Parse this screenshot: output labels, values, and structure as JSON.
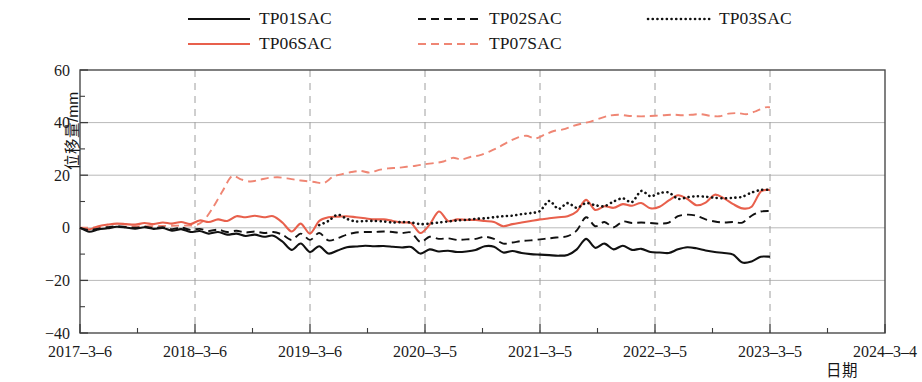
{
  "chart_data": {
    "type": "line",
    "title": "",
    "xlabel": "日期",
    "ylabel": "位移量/mm",
    "ylim": [
      -40,
      60
    ],
    "ytick_labels": [
      "60",
      "40",
      "20",
      "0",
      "-20",
      "-40"
    ],
    "ytick_values": [
      60,
      40,
      20,
      0,
      -20,
      -40
    ],
    "yminor_step": 10,
    "xtick_labels": [
      "2017-3-6",
      "2018-3-6",
      "2019-3-6",
      "2020-3-5",
      "2021-3-5",
      "2022-3-5",
      "2023-3-5",
      "2024-3-4"
    ],
    "xlim_labels": [
      "2017-3-6",
      "2024-3-4"
    ],
    "grid": "both major x dashed grey, major y solid grey",
    "legend_position": "above-plot",
    "x_unit": "years from 2017-3-6",
    "series": [
      {
        "name": "TP01SAC",
        "color": "#111111",
        "style": "solid",
        "x": [
          0.0,
          0.08,
          0.16,
          0.24,
          0.32,
          0.4,
          0.48,
          0.56,
          0.64,
          0.72,
          0.8,
          0.88,
          0.96,
          1.04,
          1.12,
          1.2,
          1.28,
          1.36,
          1.44,
          1.52,
          1.6,
          1.68,
          1.76,
          1.84,
          1.92,
          2.0,
          2.08,
          2.16,
          2.24,
          2.32,
          2.4,
          2.48,
          2.56,
          2.64,
          2.72,
          2.8,
          2.88,
          2.96,
          3.04,
          3.12,
          3.2,
          3.28,
          3.36,
          3.44,
          3.52,
          3.6,
          3.68,
          3.76,
          3.84,
          3.92,
          4.0,
          4.08,
          4.16,
          4.24,
          4.32,
          4.4,
          4.48,
          4.56,
          4.64,
          4.72,
          4.8,
          4.88,
          4.96,
          5.04,
          5.12,
          5.2,
          5.28,
          5.36,
          5.44,
          5.52,
          5.6,
          5.68,
          5.76,
          5.84,
          5.92,
          6.0
        ],
        "y": [
          0.0,
          -1.5,
          -0.6,
          -0.2,
          0.4,
          0.1,
          -0.3,
          0.2,
          -0.4,
          -0.1,
          -1.1,
          -0.5,
          -1.6,
          -1.2,
          -2.2,
          -1.6,
          -2.6,
          -2.2,
          -3.1,
          -2.6,
          -3.4,
          -3.0,
          -5.2,
          -8.4,
          -6.0,
          -9.2,
          -7.0,
          -9.8,
          -8.6,
          -7.4,
          -7.1,
          -6.8,
          -7.0,
          -6.9,
          -7.2,
          -7.5,
          -7.3,
          -9.8,
          -8.2,
          -9.0,
          -8.7,
          -9.2,
          -9.0,
          -8.4,
          -7.0,
          -7.2,
          -9.4,
          -8.8,
          -9.6,
          -10.0,
          -10.2,
          -10.4,
          -10.6,
          -10.3,
          -8.2,
          -4.2,
          -7.6,
          -6.0,
          -8.2,
          -6.8,
          -8.4,
          -8.0,
          -9.2,
          -9.4,
          -9.6,
          -8.2,
          -7.4,
          -7.8,
          -8.6,
          -9.2,
          -9.6,
          -10.2,
          -13.2,
          -12.8,
          -11.0,
          -11.0
        ]
      },
      {
        "name": "TP02SAC",
        "color": "#111111",
        "style": "dashed",
        "x": [
          0.0,
          0.08,
          0.16,
          0.24,
          0.32,
          0.4,
          0.48,
          0.56,
          0.64,
          0.72,
          0.8,
          0.88,
          0.96,
          1.04,
          1.12,
          1.2,
          1.28,
          1.36,
          1.44,
          1.52,
          1.6,
          1.68,
          1.76,
          1.84,
          1.92,
          2.0,
          2.08,
          2.16,
          2.24,
          2.32,
          2.4,
          2.48,
          2.56,
          2.64,
          2.72,
          2.8,
          2.88,
          2.96,
          3.04,
          3.12,
          3.2,
          3.28,
          3.36,
          3.44,
          3.52,
          3.6,
          3.68,
          3.76,
          3.84,
          3.92,
          4.0,
          4.08,
          4.16,
          4.24,
          4.32,
          4.4,
          4.48,
          4.56,
          4.64,
          4.72,
          4.8,
          4.88,
          4.96,
          5.04,
          5.12,
          5.2,
          5.28,
          5.36,
          5.44,
          5.52,
          5.6,
          5.68,
          5.76,
          5.84,
          5.92,
          6.0
        ],
        "y": [
          0.0,
          -0.9,
          -0.3,
          0.2,
          0.6,
          0.3,
          0.0,
          0.4,
          -0.1,
          0.2,
          -0.5,
          0.1,
          -0.8,
          -0.4,
          -1.2,
          -0.7,
          -1.6,
          -1.1,
          -1.8,
          -1.4,
          -2.0,
          -1.6,
          -2.6,
          -4.6,
          -2.2,
          -4.6,
          -2.0,
          -4.8,
          -4.0,
          -2.6,
          -1.8,
          -1.6,
          -1.6,
          -1.4,
          -1.6,
          -2.0,
          -1.8,
          -5.4,
          -3.4,
          -4.2,
          -4.0,
          -4.6,
          -4.4,
          -4.2,
          -3.4,
          -4.2,
          -6.0,
          -5.6,
          -5.0,
          -4.8,
          -4.4,
          -4.0,
          -3.6,
          -3.2,
          -1.0,
          4.0,
          0.6,
          2.2,
          0.2,
          2.4,
          1.8,
          2.0,
          1.8,
          1.6,
          2.0,
          4.4,
          5.0,
          4.6,
          3.2,
          2.4,
          2.0,
          2.2,
          2.0,
          4.6,
          6.2,
          6.4
        ]
      },
      {
        "name": "TP03SAC",
        "color": "#111111",
        "style": "dotted",
        "x": [
          2.08,
          2.16,
          2.24,
          2.32,
          2.4,
          2.48,
          2.56,
          2.64,
          2.72,
          2.8,
          2.88,
          2.96,
          3.04,
          3.12,
          3.2,
          3.28,
          3.36,
          3.44,
          3.52,
          3.6,
          3.68,
          3.76,
          3.84,
          3.92,
          4.0,
          4.08,
          4.16,
          4.24,
          4.32,
          4.4,
          4.48,
          4.56,
          4.64,
          4.72,
          4.8,
          4.88,
          4.96,
          5.04,
          5.12,
          5.2,
          5.28,
          5.36,
          5.44,
          5.52,
          5.6,
          5.68,
          5.76,
          5.84,
          5.92,
          6.0
        ],
        "y": [
          1.0,
          2.6,
          5.0,
          3.4,
          2.4,
          2.6,
          2.6,
          2.4,
          2.0,
          2.2,
          2.0,
          1.4,
          1.6,
          2.0,
          2.4,
          2.8,
          3.0,
          3.4,
          3.6,
          4.0,
          4.4,
          4.6,
          5.2,
          5.6,
          6.4,
          10.2,
          7.2,
          9.4,
          7.6,
          9.4,
          8.6,
          8.2,
          10.0,
          11.2,
          9.8,
          14.0,
          12.0,
          13.2,
          13.4,
          11.0,
          11.6,
          12.0,
          11.8,
          11.4,
          11.2,
          11.4,
          11.8,
          13.4,
          14.4,
          14.4
        ]
      },
      {
        "name": "TP06SAC",
        "color": "#e8604c",
        "style": "solid",
        "x": [
          0.0,
          0.08,
          0.16,
          0.24,
          0.32,
          0.4,
          0.48,
          0.56,
          0.64,
          0.72,
          0.8,
          0.88,
          0.96,
          1.04,
          1.12,
          1.2,
          1.28,
          1.36,
          1.44,
          1.52,
          1.6,
          1.68,
          1.76,
          1.84,
          1.92,
          2.0,
          2.08,
          2.16,
          2.24,
          2.32,
          2.4,
          2.48,
          2.56,
          2.64,
          2.72,
          2.8,
          2.88,
          2.96,
          3.04,
          3.12,
          3.2,
          3.28,
          3.36,
          3.44,
          3.52,
          3.6,
          3.68,
          3.76,
          3.84,
          3.92,
          4.0,
          4.08,
          4.16,
          4.24,
          4.32,
          4.4,
          4.48,
          4.56,
          4.64,
          4.72,
          4.8,
          4.88,
          4.96,
          5.04,
          5.12,
          5.2,
          5.28,
          5.36,
          5.44,
          5.52,
          5.6,
          5.68,
          5.76,
          5.84,
          5.92,
          6.0
        ],
        "y": [
          0.0,
          -0.6,
          0.6,
          1.2,
          1.6,
          1.4,
          1.2,
          1.8,
          1.4,
          2.0,
          1.6,
          2.2,
          1.4,
          2.8,
          2.2,
          3.2,
          2.6,
          4.4,
          4.0,
          4.6,
          4.0,
          4.4,
          2.0,
          -1.4,
          1.6,
          -2.2,
          2.6,
          4.0,
          4.2,
          4.4,
          4.0,
          3.6,
          3.2,
          3.2,
          2.6,
          2.0,
          1.8,
          -2.0,
          1.2,
          6.2,
          2.6,
          3.2,
          3.0,
          3.0,
          2.6,
          2.2,
          0.6,
          1.4,
          2.0,
          2.6,
          3.2,
          3.6,
          4.0,
          4.4,
          6.2,
          10.6,
          6.8,
          8.2,
          7.6,
          9.0,
          8.4,
          9.4,
          7.4,
          8.0,
          10.4,
          12.4,
          11.0,
          8.6,
          9.6,
          12.6,
          11.2,
          9.0,
          7.4,
          8.0,
          13.8,
          14.4
        ]
      },
      {
        "name": "TP07SAC",
        "color": "#ef8674",
        "style": "dashed",
        "x": [
          0.0,
          0.4,
          0.8,
          1.0,
          1.08,
          1.16,
          1.24,
          1.32,
          1.4,
          1.48,
          1.56,
          1.64,
          1.72,
          1.8,
          1.88,
          1.96,
          2.04,
          2.12,
          2.2,
          2.28,
          2.36,
          2.44,
          2.52,
          2.6,
          2.68,
          2.76,
          2.84,
          2.92,
          3.0,
          3.08,
          3.16,
          3.24,
          3.32,
          3.4,
          3.48,
          3.56,
          3.64,
          3.72,
          3.8,
          3.88,
          3.96,
          4.04,
          4.12,
          4.2,
          4.28,
          4.36,
          4.44,
          4.52,
          4.6,
          4.68,
          4.76,
          4.84,
          4.92,
          5.0,
          5.08,
          5.16,
          5.24,
          5.32,
          5.4,
          5.48,
          5.56,
          5.64,
          5.72,
          5.8,
          5.88,
          5.96,
          6.0
        ],
        "y": [
          0.0,
          0.4,
          0.8,
          1.0,
          3.0,
          8.0,
          14.0,
          19.6,
          18.4,
          17.6,
          18.2,
          19.0,
          19.2,
          18.8,
          18.2,
          17.8,
          17.4,
          17.0,
          19.4,
          20.4,
          21.2,
          21.6,
          21.0,
          22.0,
          22.6,
          22.8,
          23.2,
          23.6,
          24.2,
          24.6,
          25.2,
          26.6,
          26.0,
          27.0,
          27.6,
          29.0,
          30.6,
          32.6,
          34.2,
          35.0,
          34.0,
          35.4,
          36.8,
          37.4,
          38.6,
          39.6,
          40.4,
          41.6,
          42.6,
          43.0,
          42.6,
          42.4,
          42.4,
          42.6,
          42.8,
          43.0,
          42.8,
          43.0,
          43.2,
          42.6,
          42.4,
          43.4,
          43.6,
          43.2,
          44.4,
          45.8,
          45.8
        ]
      }
    ]
  },
  "legend": {
    "items": [
      {
        "label": "TP01SAC",
        "series": "TP01SAC"
      },
      {
        "label": "TP02SAC",
        "series": "TP02SAC"
      },
      {
        "label": "TP03SAC",
        "series": "TP03SAC"
      },
      {
        "label": "TP06SAC",
        "series": "TP06SAC"
      },
      {
        "label": "TP07SAC",
        "series": "TP07SAC"
      }
    ]
  }
}
